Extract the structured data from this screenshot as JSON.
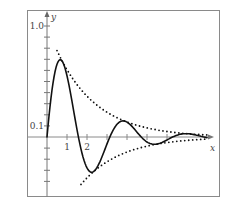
{
  "chart_data": {
    "type": "line",
    "title": "",
    "xlabel": "x",
    "ylabel": "y",
    "xlim": [
      -1,
      8.6
    ],
    "ylim": [
      -0.53,
      1.14
    ],
    "grid": false,
    "legend": "none",
    "x_ticks": [
      1,
      2,
      3,
      4,
      5,
      6
    ],
    "x_tick_labels": [
      {
        "value": 1,
        "label": "1"
      },
      {
        "value": 2,
        "label": "2"
      }
    ],
    "y_ticks": [
      -0.4,
      -0.3,
      -0.2,
      -0.1,
      0.1,
      0.2,
      0.3,
      0.4,
      0.5,
      0.6,
      0.7,
      0.8,
      0.9,
      1.0
    ],
    "y_tick_labels": [
      {
        "value": 1.0,
        "label": "1.0"
      },
      {
        "value": 0.1,
        "label": "0.1"
      }
    ],
    "series": [
      {
        "name": "damped oscillation",
        "style": "solid",
        "formula": "e^(-x/2) sin(2x)",
        "x": [
          0,
          0.25,
          0.5,
          0.75,
          1.0,
          1.25,
          1.5,
          1.75,
          2.0,
          2.25,
          2.5,
          2.75,
          3.0,
          3.25,
          3.5,
          3.75,
          4.0,
          4.25,
          4.5,
          4.75,
          5.0,
          5.25,
          5.5,
          5.75,
          6.0,
          6.5,
          7.0,
          7.5,
          8.0
        ],
        "values": [
          0,
          0.42,
          0.66,
          0.68,
          0.55,
          0.32,
          0.07,
          -0.15,
          -0.28,
          -0.32,
          -0.27,
          -0.18,
          -0.06,
          0.04,
          0.11,
          0.14,
          0.13,
          0.09,
          0.04,
          -0.01,
          -0.04,
          -0.06,
          -0.06,
          -0.05,
          -0.03,
          0.02,
          0.03,
          0.02,
          0.0
        ]
      },
      {
        "name": "upper envelope",
        "style": "dotted",
        "formula": "e^(-x/2)",
        "x": [
          0.5,
          1.0,
          1.5,
          2.0,
          2.5,
          3.0,
          3.5,
          4.0,
          4.5,
          5.0,
          5.5,
          6.0,
          6.5,
          7.0,
          7.5,
          8.0
        ],
        "values": [
          0.78,
          0.61,
          0.47,
          0.37,
          0.29,
          0.22,
          0.17,
          0.14,
          0.11,
          0.08,
          0.06,
          0.05,
          0.04,
          0.03,
          0.02,
          0.02
        ]
      },
      {
        "name": "lower envelope",
        "style": "dotted",
        "formula": "-e^(-x/2)",
        "x": [
          1.7,
          2.0,
          2.5,
          3.0,
          3.5,
          4.0,
          4.5,
          5.0,
          5.5,
          6.0,
          6.5,
          7.0,
          7.5,
          8.0
        ],
        "values": [
          -0.43,
          -0.37,
          -0.29,
          -0.22,
          -0.17,
          -0.14,
          -0.11,
          -0.08,
          -0.06,
          -0.05,
          -0.04,
          -0.03,
          -0.02,
          -0.02
        ]
      }
    ]
  }
}
